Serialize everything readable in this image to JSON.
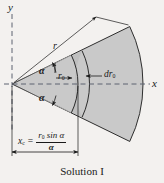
{
  "figure": {
    "caption": "Solution I",
    "background_color": "#f3f1ef",
    "sector_fill_color": "#c9c9c9",
    "strip_fill_color": "#bcbcbc",
    "line_color": "#1a1a1a",
    "axes": {
      "y_label": "y",
      "x_label": "x",
      "style": "dashed center lines"
    },
    "labels": {
      "radius": "r",
      "angle_upper": "α",
      "angle_lower": "α",
      "inner_radius": "r",
      "inner_radius_sub": "0",
      "differential": "dr",
      "differential_sub": "0"
    },
    "equation": {
      "lhs": "x",
      "lhs_sub": "c",
      "equals": "=",
      "numerator": "r",
      "numerator_sub": "0",
      "numerator_rest": " sin α",
      "denominator": "α"
    },
    "dimension": {
      "name": "x_c",
      "description": "horizontal distance from apex to centroid"
    }
  }
}
